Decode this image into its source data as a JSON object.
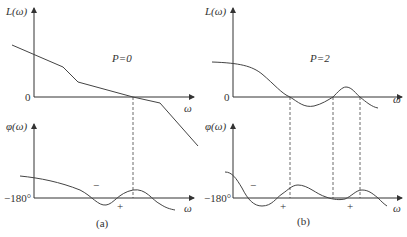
{
  "figure": {
    "panels": [
      {
        "id": "a",
        "caption": "(a)",
        "param_label": "P=0",
        "magnitude": {
          "ylabel": "L(ω)",
          "xlabel": "ω",
          "zero_label": "0"
        },
        "phase": {
          "ylabel": "φ(ω)",
          "xlabel": "ω",
          "ref_label": "−180°",
          "signs": [
            "−",
            "+"
          ]
        }
      },
      {
        "id": "b",
        "caption": "(b)",
        "param_label": "P=2",
        "magnitude": {
          "ylabel": "L(ω)",
          "xlabel": "ω",
          "zero_label": "0"
        },
        "phase": {
          "ylabel": "φ(ω)",
          "xlabel": "ω",
          "ref_label": "−180°",
          "signs": [
            "−",
            "+",
            "+"
          ]
        }
      }
    ]
  }
}
